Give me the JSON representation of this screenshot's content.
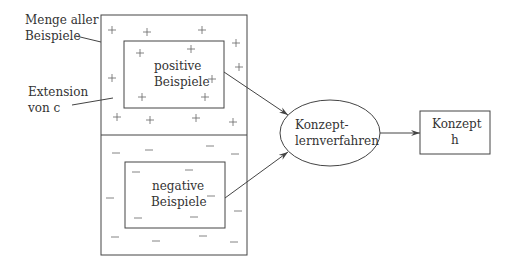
{
  "labels": {
    "all_examples_line1": "Menge aller",
    "all_examples_line2": "Beispiele",
    "extension_line1": "Extension",
    "extension_line2": "von c",
    "positive_line1": "positive",
    "positive_line2": "Beispiele",
    "negative_line1": "negative",
    "negative_line2": "Beispiele",
    "learner_line1": "Konzept-",
    "learner_line2": "lernverfahren",
    "concept_line1": "Konzept",
    "concept_line2": "h"
  },
  "symbols": {
    "plus": "+",
    "minus": "–",
    "plus_positions": [
      [
        112,
        30
      ],
      [
        147,
        32
      ],
      [
        202,
        30
      ],
      [
        236,
        43
      ],
      [
        140,
        53
      ],
      [
        191,
        49
      ],
      [
        239,
        67
      ],
      [
        112,
        78
      ],
      [
        212,
        79
      ],
      [
        142,
        97
      ],
      [
        205,
        97
      ],
      [
        117,
        117
      ],
      [
        150,
        120
      ],
      [
        196,
        118
      ],
      [
        233,
        122
      ]
    ],
    "minus_positions": [
      [
        116,
        153
      ],
      [
        149,
        150
      ],
      [
        210,
        146
      ],
      [
        235,
        154
      ],
      [
        136,
        172
      ],
      [
        189,
        170
      ],
      [
        110,
        198
      ],
      [
        211,
        196
      ],
      [
        238,
        211
      ],
      [
        138,
        218
      ],
      [
        194,
        217
      ],
      [
        115,
        237
      ],
      [
        156,
        241
      ],
      [
        203,
        236
      ],
      [
        234,
        242
      ]
    ]
  },
  "colors": {
    "stroke": "#444444",
    "text": "#333333"
  }
}
